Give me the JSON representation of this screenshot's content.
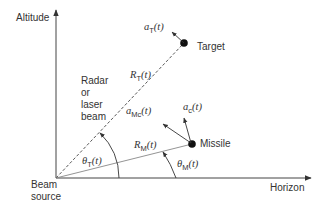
{
  "diagram": {
    "axes": {
      "vertical_label": "Altitude",
      "horizontal_label": "Horizon"
    },
    "origin_label": [
      "Beam",
      "source"
    ],
    "beam_label": [
      "Radar",
      "or",
      "laser",
      "beam"
    ],
    "nodes": {
      "target": {
        "label": "Target"
      },
      "missile": {
        "label": "Missile"
      }
    },
    "vectors": {
      "target_accel": {
        "symbol": "a",
        "subscript": "T",
        "arg": "(t)"
      },
      "missile_accel_mc": {
        "symbol": "a",
        "subscript": "Mc",
        "arg": "(t)"
      },
      "missile_accel_c": {
        "symbol": "a",
        "subscript": "c",
        "arg": "(t)"
      }
    },
    "ranges": {
      "target_range": {
        "symbol": "R",
        "subscript": "T",
        "arg": "(t)"
      },
      "missile_range": {
        "symbol": "R",
        "subscript": "M",
        "arg": "(t)"
      }
    },
    "angles": {
      "target_angle": {
        "symbol": "θ",
        "subscript": "T",
        "arg": "(t)"
      },
      "missile_angle": {
        "symbol": "θ",
        "subscript": "M",
        "arg": "(t)"
      }
    },
    "colors": {
      "line": "#333333",
      "dot": "#111111"
    }
  }
}
